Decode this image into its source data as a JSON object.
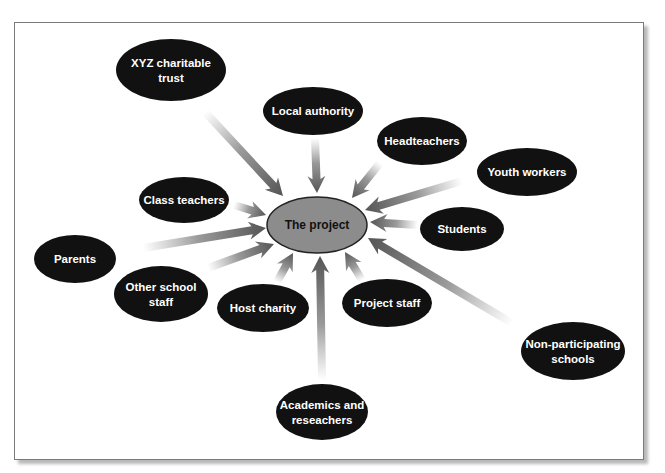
{
  "diagram": {
    "colors": {
      "node_fill": "#111111",
      "node_text": "#ffffff",
      "center_fill": "#8c8c8c",
      "center_stroke": "#222222",
      "center_text": "#111111",
      "arrow_head": "#555555",
      "arrow_tail": "#ffffff",
      "frame_border": "#7a7a7a"
    },
    "center": {
      "label": "The project",
      "cx": 317,
      "cy": 225,
      "rx": 50,
      "ry": 28
    },
    "nodes": [
      {
        "id": "xyz-charitable-trust",
        "lines": [
          "XYZ charitable",
          "trust"
        ],
        "cx": 171,
        "cy": 70,
        "rx": 55,
        "ry": 31,
        "arrow": {
          "x1": 205,
          "y1": 112,
          "x2": 283,
          "y2": 196
        }
      },
      {
        "id": "local-authority",
        "lines": [
          "Local authority"
        ],
        "cx": 313,
        "cy": 111,
        "rx": 50,
        "ry": 24,
        "arrow": {
          "x1": 315,
          "y1": 138,
          "x2": 317,
          "y2": 193
        }
      },
      {
        "id": "headteachers",
        "lines": [
          "Headteachers"
        ],
        "cx": 422,
        "cy": 141,
        "rx": 45,
        "ry": 24,
        "arrow": {
          "x1": 380,
          "y1": 163,
          "x2": 352,
          "y2": 198
        }
      },
      {
        "id": "youth-workers",
        "lines": [
          "Youth workers"
        ],
        "cx": 527,
        "cy": 172,
        "rx": 50,
        "ry": 24,
        "arrow": {
          "x1": 462,
          "y1": 181,
          "x2": 365,
          "y2": 210
        }
      },
      {
        "id": "students",
        "lines": [
          "Students"
        ],
        "cx": 462,
        "cy": 229,
        "rx": 42,
        "ry": 22,
        "arrow": {
          "x1": 418,
          "y1": 225,
          "x2": 370,
          "y2": 222
        }
      },
      {
        "id": "class-teachers",
        "lines": [
          "Class teachers"
        ],
        "cx": 184,
        "cy": 200,
        "rx": 45,
        "ry": 23,
        "arrow": {
          "x1": 234,
          "y1": 205,
          "x2": 266,
          "y2": 215
        }
      },
      {
        "id": "parents",
        "lines": [
          "Parents"
        ],
        "cx": 75,
        "cy": 259,
        "rx": 41,
        "ry": 24,
        "arrow": {
          "x1": 143,
          "y1": 248,
          "x2": 266,
          "y2": 228
        }
      },
      {
        "id": "other-school-staff",
        "lines": [
          "Other  school",
          "staff"
        ],
        "cx": 161,
        "cy": 294,
        "rx": 47,
        "ry": 28,
        "arrow": {
          "x1": 208,
          "y1": 268,
          "x2": 274,
          "y2": 244
        }
      },
      {
        "id": "host-charity",
        "lines": [
          "Host charity"
        ],
        "cx": 263,
        "cy": 308,
        "rx": 46,
        "ry": 24,
        "arrow": {
          "x1": 277,
          "y1": 282,
          "x2": 293,
          "y2": 253
        }
      },
      {
        "id": "project-staff",
        "lines": [
          "Project staff"
        ],
        "cx": 387,
        "cy": 303,
        "rx": 45,
        "ry": 24,
        "arrow": {
          "x1": 362,
          "y1": 280,
          "x2": 345,
          "y2": 252
        }
      },
      {
        "id": "non-participating-schools",
        "lines": [
          "Non-participating",
          "schools"
        ],
        "cx": 573,
        "cy": 351,
        "rx": 52,
        "ry": 29,
        "arrow": {
          "x1": 512,
          "y1": 323,
          "x2": 368,
          "y2": 238
        }
      },
      {
        "id": "academics-and-reseachers",
        "lines": [
          "Academics and",
          "reseachers"
        ],
        "cx": 322,
        "cy": 412,
        "rx": 46,
        "ry": 28,
        "arrow": {
          "x1": 322,
          "y1": 380,
          "x2": 320,
          "y2": 256
        }
      }
    ]
  }
}
